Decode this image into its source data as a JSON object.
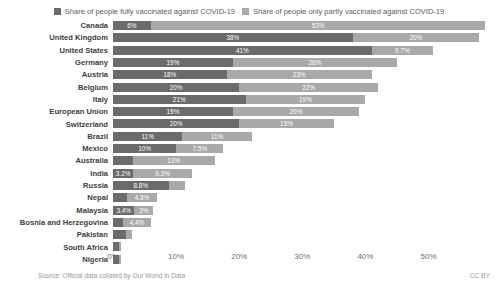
{
  "legend": {
    "items": [
      {
        "label": "Share of people fully vaccinated against COVID-19",
        "color": "#6b6b6b",
        "key": "full"
      },
      {
        "label": "Share of people only partly vaccinated against COVID-19",
        "color": "#a9a9a9",
        "key": "partly"
      }
    ]
  },
  "footer": {
    "source": "Source: Official data collated by Our World in Data",
    "license": "CC BY"
  },
  "chart_data": {
    "type": "bar",
    "orientation": "horizontal",
    "stacked": true,
    "title": "",
    "subtitle": "",
    "xlabel": "",
    "ylabel": "",
    "xlim": [
      0,
      60
    ],
    "xticks": [
      0,
      10,
      20,
      30,
      40,
      50
    ],
    "xtick_labels": [
      "0%",
      "10%",
      "20%",
      "30%",
      "40%",
      "50%"
    ],
    "grid": false,
    "legend_position": "top-center",
    "categories": [
      "Canada",
      "United Kingdom",
      "United States",
      "Germany",
      "Austria",
      "Belgium",
      "Italy",
      "European Union",
      "Switzerland",
      "Brazil",
      "Mexico",
      "Australia",
      "India",
      "Russia",
      "Nepal",
      "Malaysia",
      "Bosnia and Herzegovina",
      "Pakistan",
      "South Africa",
      "Nigeria"
    ],
    "series": [
      {
        "name": "Share of people fully vaccinated against COVID-19",
        "key": "full",
        "color": "#6b6b6b",
        "values": [
          6,
          38,
          41,
          19,
          18,
          20,
          21,
          19,
          20,
          11,
          10,
          3.1,
          3.2,
          8.8,
          2.2,
          3.4,
          1.6,
          2.1,
          1.0,
          0.9
        ],
        "labels": [
          "6%",
          "38%",
          "41%",
          "19%",
          "18%",
          "20%",
          "21%",
          "19%",
          "20%",
          "11%",
          "10%",
          "",
          "3.2%",
          "8.8%",
          "",
          "3.4%",
          "",
          "",
          "",
          ""
        ]
      },
      {
        "name": "Share of people only partly vaccinated against COVID-19",
        "key": "partly",
        "color": "#a9a9a9",
        "values": [
          53,
          20,
          9.7,
          26,
          23,
          22,
          19,
          20,
          15,
          11,
          7.5,
          13,
          9.3,
          2.6,
          4.8,
          3.0,
          4.4,
          0.9,
          0.3,
          0.3
        ],
        "labels": [
          "53%",
          "20%",
          "9.7%",
          "26%",
          "23%",
          "22%",
          "19%",
          "20%",
          "15%",
          "11%",
          "7.5%",
          "13%",
          "9.3%",
          "",
          "4.8%",
          "3%",
          "4.4%",
          "",
          "",
          ""
        ]
      }
    ]
  }
}
